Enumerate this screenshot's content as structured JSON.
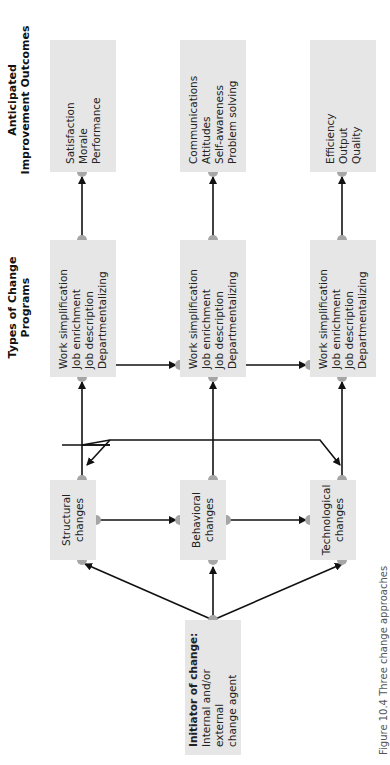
{
  "headings": {
    "programs": [
      "Types of Change",
      "Programs"
    ],
    "outcomes": [
      "Anticipated",
      "Improvement Outcomes"
    ]
  },
  "initiator": {
    "title": "Initiator of change:",
    "lines": [
      "Internal and/or external",
      "change agent"
    ]
  },
  "changes": [
    {
      "lines": [
        "Structural",
        "changes"
      ]
    },
    {
      "lines": [
        "Behavioral",
        "changes"
      ]
    },
    {
      "lines": [
        "Technological",
        "changes"
      ]
    }
  ],
  "programs": [
    {
      "lines": [
        "Work simplification",
        "Job enrichment",
        "Job description",
        "Departmentalizing"
      ]
    },
    {
      "lines": [
        "Work simplification",
        "Job enrichment",
        "Job description",
        "Departmentalizing"
      ]
    },
    {
      "lines": [
        "Work simplification",
        "Job enrichment",
        "Job description",
        "Departmentalizing"
      ]
    }
  ],
  "outcomes": [
    {
      "lines": [
        "Satisfaction",
        "Morale",
        "Performance"
      ]
    },
    {
      "lines": [
        "Communications",
        "Attitudes",
        "Self-awareness",
        "Problem solving"
      ]
    },
    {
      "lines": [
        "Efficiency",
        "Output",
        "Quality"
      ]
    }
  ],
  "caption": "Figure 10.4   Three change approaches",
  "colors": {
    "box_fill": "#e6e6e6",
    "node_dot": "#a6a6a6",
    "arrow": "#111111"
  }
}
